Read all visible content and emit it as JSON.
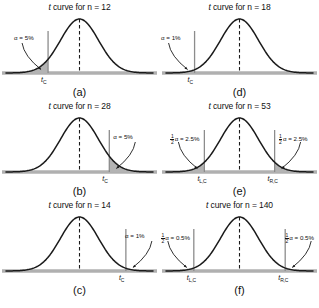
{
  "figure": {
    "background": "#ffffff",
    "curve_color": "#1a1a1a",
    "shade_color": "#b3b3b3",
    "baseline_color": "#b0b0b0",
    "critical_line_color": "#8c8c8c"
  },
  "chart_data": {
    "type": "line",
    "xlabel": "",
    "ylabel": "",
    "panels": [
      {
        "letter": "(a)",
        "title_prefix": "t",
        "title_rest": " curve for n = 12",
        "n": 12,
        "df": 11,
        "tail": "left",
        "alpha_label": "α = 5%",
        "alpha_percent": 5,
        "tick_labels": [
          "t"
        ],
        "tick_subs": [
          "C"
        ],
        "critical_x": [
          -1.796
        ]
      },
      {
        "letter": "(b)",
        "title_prefix": "t",
        "title_rest": " curve for n = 28",
        "n": 28,
        "df": 27,
        "tail": "right",
        "alpha_label": "α = 5%",
        "alpha_percent": 5,
        "tick_labels": [
          "t"
        ],
        "tick_subs": [
          "C"
        ],
        "critical_x": [
          1.703
        ]
      },
      {
        "letter": "(c)",
        "title_prefix": "t",
        "title_rest": " curve for n = 14",
        "n": 14,
        "df": 13,
        "tail": "right",
        "alpha_label": "α = 1%",
        "alpha_percent": 1,
        "tick_labels": [
          "t"
        ],
        "tick_subs": [
          "C"
        ],
        "critical_x": [
          2.65
        ]
      },
      {
        "letter": "(d)",
        "title_prefix": "t",
        "title_rest": " curve for n = 18",
        "n": 18,
        "df": 17,
        "tail": "left",
        "alpha_label": "α = 1%",
        "alpha_percent": 1,
        "tick_labels": [
          "t"
        ],
        "tick_subs": [
          "C"
        ],
        "critical_x": [
          -2.567
        ]
      },
      {
        "letter": "(e)",
        "title_prefix": "t",
        "title_rest": " curve for n = 53",
        "n": 53,
        "df": 52,
        "tail": "two",
        "alpha_num": "1",
        "alpha_den": "2",
        "alpha_label": "α = 2.5%",
        "alpha_percent": 2.5,
        "tick_labels": [
          "t",
          "t"
        ],
        "tick_subs": [
          "L,C",
          "R,C"
        ],
        "critical_x": [
          -2.007,
          2.007
        ]
      },
      {
        "letter": "(f)",
        "title_prefix": "t",
        "title_rest": " curve for n = 140",
        "n": 140,
        "df": 139,
        "tail": "two",
        "alpha_num": "1",
        "alpha_den": "2",
        "alpha_label": "α = 0.5%",
        "alpha_percent": 0.5,
        "tick_labels": [
          "t",
          "t"
        ],
        "tick_subs": [
          "L,C",
          "R,C"
        ],
        "critical_x": [
          -2.611,
          2.611
        ]
      }
    ]
  }
}
